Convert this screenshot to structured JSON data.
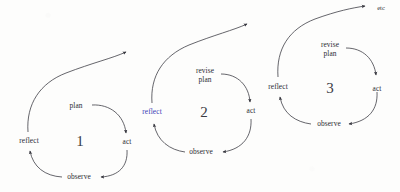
{
  "diagram": {
    "title": "Iterative plan-act-observe-reflect cycles",
    "background_color": "#fdfdfc",
    "ink_color": "#33333b",
    "accent_color": "#3b3bb5",
    "style": "hand-drawn scanned line diagram",
    "cycles": [
      {
        "number": "1",
        "labels": {
          "plan": "plan",
          "act": "act",
          "observe": "observe",
          "reflect": "reflect"
        },
        "reflect_color": "#2b2b33"
      },
      {
        "number": "2",
        "labels": {
          "plan": "revise\nplan",
          "act": "act",
          "observe": "observe",
          "reflect": "reflect"
        },
        "reflect_color": "#3b3bb5"
      },
      {
        "number": "3",
        "labels": {
          "plan": "revise\nplan",
          "act": "act",
          "observe": "observe",
          "reflect": "reflect"
        },
        "reflect_color": "#2b2b33"
      }
    ],
    "terminal_label": "etc"
  }
}
